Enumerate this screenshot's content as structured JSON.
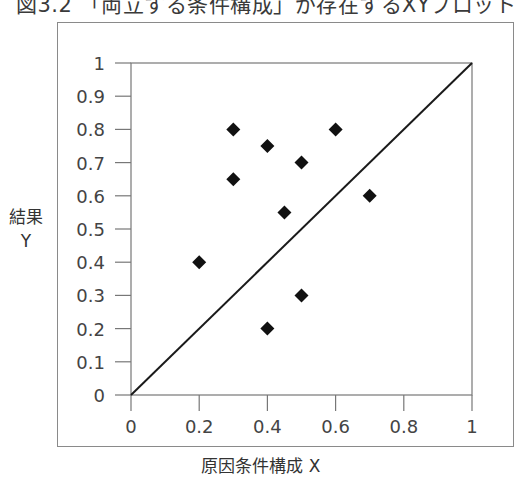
{
  "figure": {
    "title": "図3.2 「両立する条件構成」が存在するXYプロット",
    "xlabel": "原因条件構成 X",
    "ylabel_line1": "結果",
    "ylabel_line2": "Y"
  },
  "colors": {
    "axis": "#777777",
    "frame": "#8a8a8a",
    "diagonal": "#1a1a1a",
    "marker": "#111111",
    "text": "#444444"
  },
  "chart_data": {
    "type": "scatter",
    "title": "図3.2 「両立する条件構成」が存在するXYプロット",
    "xlabel": "原因条件構成 X",
    "ylabel": "結果 Y",
    "xlim": [
      0,
      1
    ],
    "ylim": [
      0,
      1
    ],
    "xticks": [
      "0",
      "0.2",
      "0.4",
      "0.6",
      "0.8",
      "1"
    ],
    "yticks": [
      "0",
      "0.1",
      "0.2",
      "0.3",
      "0.4",
      "0.5",
      "0.6",
      "0.7",
      "0.8",
      "0.9",
      "1"
    ],
    "grid": false,
    "legend": null,
    "marker": "diamond",
    "points": [
      {
        "x": 0.2,
        "y": 0.4
      },
      {
        "x": 0.3,
        "y": 0.8
      },
      {
        "x": 0.3,
        "y": 0.65
      },
      {
        "x": 0.4,
        "y": 0.75
      },
      {
        "x": 0.4,
        "y": 0.2
      },
      {
        "x": 0.45,
        "y": 0.55
      },
      {
        "x": 0.5,
        "y": 0.7
      },
      {
        "x": 0.5,
        "y": 0.3
      },
      {
        "x": 0.6,
        "y": 0.8
      },
      {
        "x": 0.7,
        "y": 0.6
      }
    ],
    "reference_line": {
      "from": [
        0,
        0
      ],
      "to": [
        1,
        1
      ],
      "label": "X = Y diagonal"
    }
  }
}
